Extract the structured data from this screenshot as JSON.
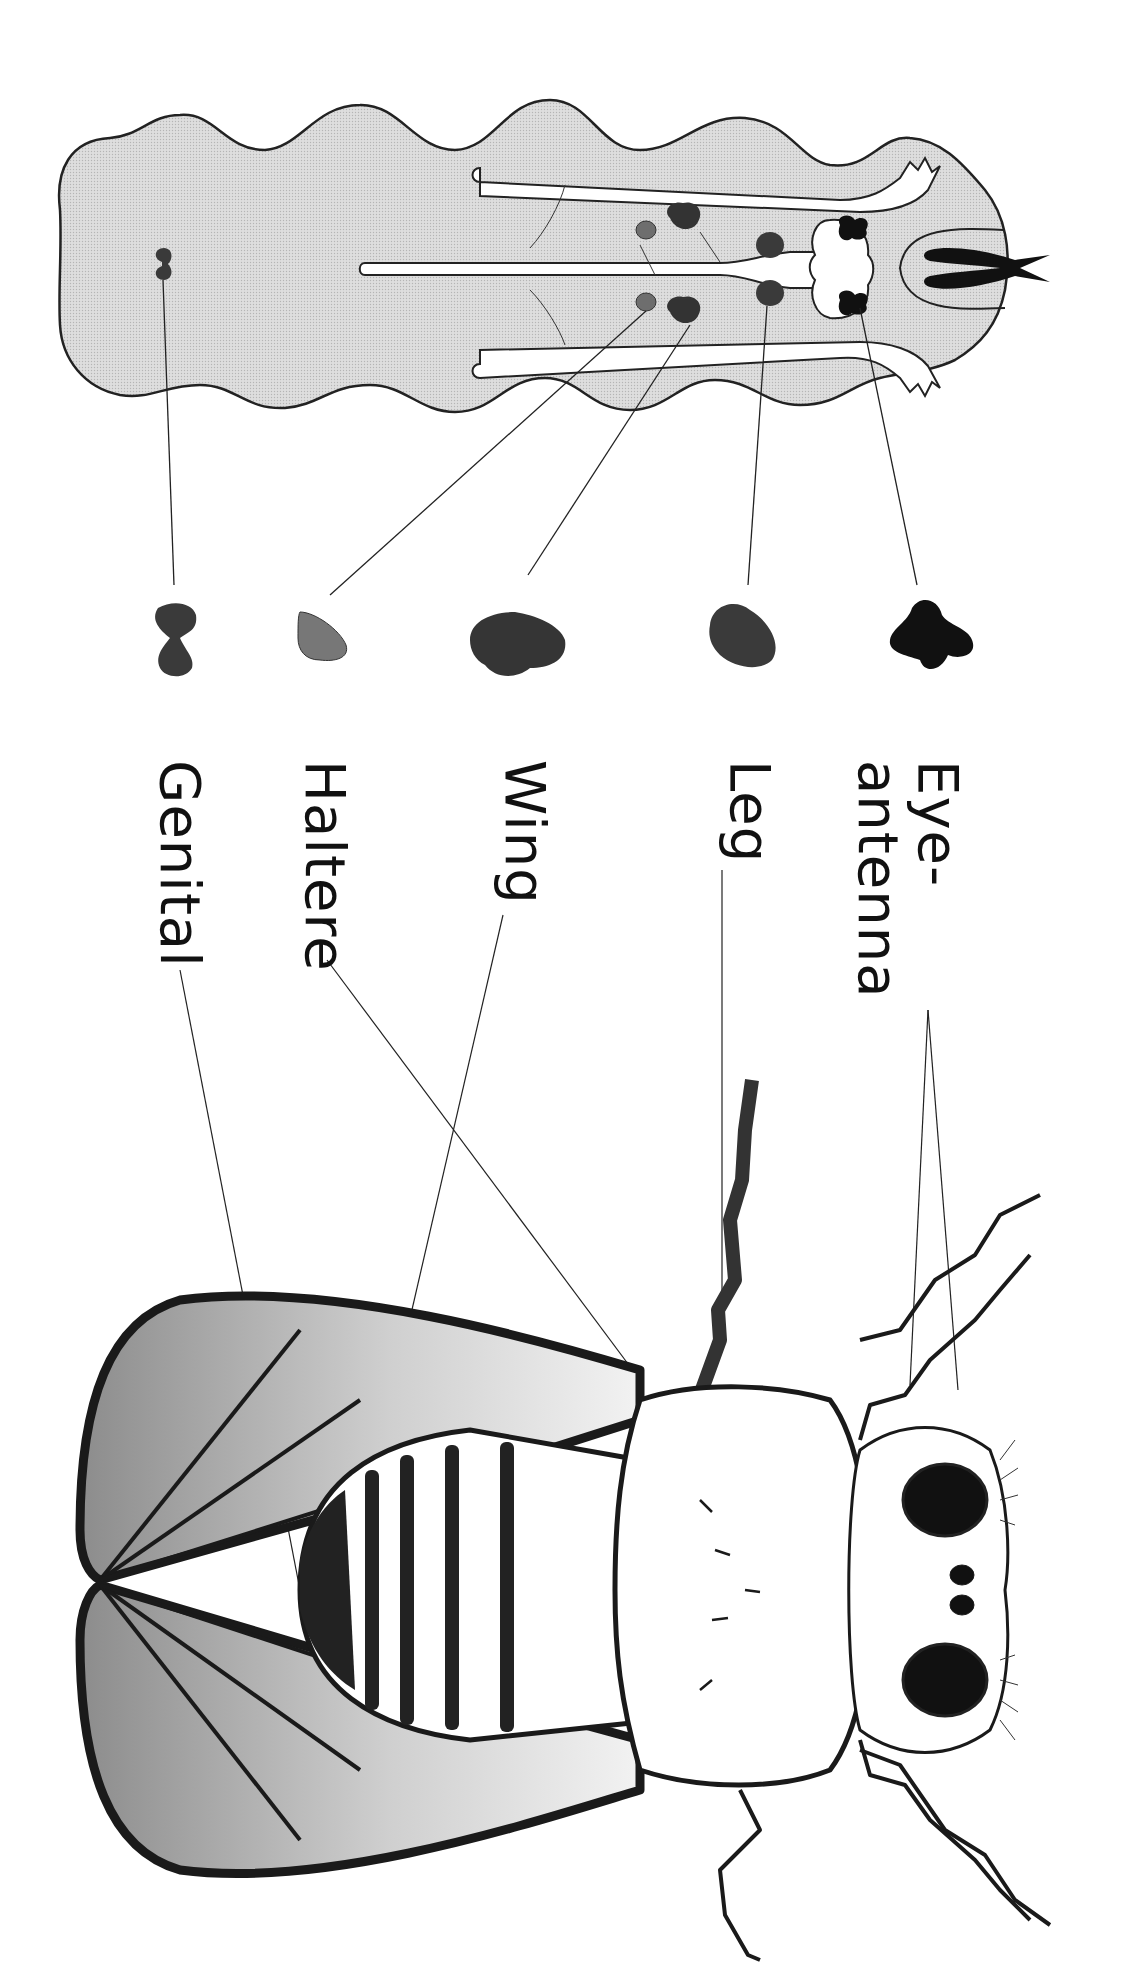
{
  "figure": {
    "type": "biology-diagram",
    "orientation": "rotated 90 degrees clockwise",
    "colors": {
      "larva_fill": "#d9d9d9",
      "outline": "#222222",
      "disc_dark": "#1a1a1a",
      "disc_medium": "#3a3a3a",
      "disc_light": "#6e6e6e",
      "wing_gradient_dark": "#8a8a8a",
      "wing_gradient_light": "#e6e6e6",
      "paper": "#ffffff"
    }
  },
  "labels": {
    "eye_antenna": "Eye-\nantenna",
    "leg": "Leg",
    "wing": "Wing",
    "haltere": "Haltere",
    "genital": "Genital"
  },
  "discs": [
    {
      "name": "eye-antenna",
      "label_key": "eye_antenna",
      "shade": "disc_dark"
    },
    {
      "name": "leg",
      "label_key": "leg",
      "shade": "disc_medium"
    },
    {
      "name": "wing",
      "label_key": "wing",
      "shade": "disc_medium"
    },
    {
      "name": "haltere",
      "label_key": "haltere",
      "shade": "disc_light"
    },
    {
      "name": "genital",
      "label_key": "genital",
      "shade": "disc_medium"
    }
  ]
}
